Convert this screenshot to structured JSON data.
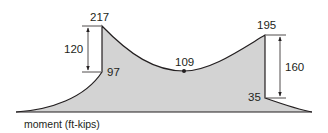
{
  "diagram": {
    "type": "moment-diagram",
    "axis_label": "moment (ft-kips)",
    "fill_color": "#d3d3d3",
    "line_color": "#231f20",
    "points": {
      "left_peak": {
        "value": "217"
      },
      "left_drop_bottom": {
        "value": "97"
      },
      "midspan_minimum": {
        "value": "109"
      },
      "right_peak": {
        "value": "195"
      },
      "right_drop_bottom": {
        "value": "35"
      }
    },
    "dimensions": {
      "left_jump": {
        "value": "120"
      },
      "right_jump": {
        "value": "160"
      }
    }
  }
}
